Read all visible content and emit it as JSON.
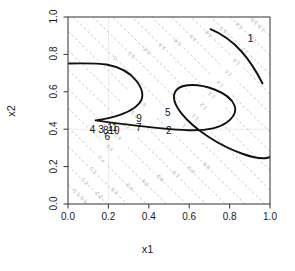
{
  "chart_data": {
    "type": "line",
    "title": "",
    "xlabel": "x1",
    "ylabel": "x2",
    "xlim": [
      0.0,
      1.0
    ],
    "ylim": [
      0.0,
      1.0
    ],
    "grid": false,
    "xticks": [
      "0.0",
      "0.2",
      "0.4",
      "0.6",
      "0.8",
      "1.0"
    ],
    "yticks": [
      "0.0",
      "0.2",
      "0.4",
      "0.6",
      "0.8",
      "1.0"
    ],
    "xtick_values": [
      0.0,
      0.2,
      0.4,
      0.6,
      0.8,
      1.0
    ],
    "ytick_values": [
      0.0,
      0.2,
      0.4,
      0.6,
      0.8,
      1.0
    ],
    "background_contours": {
      "style": "dashed-gray",
      "color": "#b8b8b8",
      "levels": [
        0.1,
        0.2,
        0.3,
        0.4,
        0.5,
        0.6,
        0.7,
        0.8,
        0.9,
        1.0,
        1.1,
        1.2,
        1.3,
        1.4,
        1.5,
        1.6,
        1.7,
        1.8,
        1.9
      ],
      "labels": [
        "0.1",
        "0.2",
        "0.3",
        "0.4",
        "0.5",
        "0.6",
        "0.7",
        "0.8",
        "0.9",
        "1",
        "1.1",
        "1.2",
        "1.3",
        "1.4",
        "1.5",
        "1.6",
        "1.7",
        "1.8",
        "1.9"
      ],
      "description": "family of parallel diagonal dashed contours running from lower-left to upper-right"
    },
    "highlighted_contours": {
      "style": "solid-black",
      "color": "#111111",
      "count": 2,
      "labels": [
        "1"
      ],
      "description": "thick black S-shaped curve through the middle of the panel and a short arc in the upper-right corner"
    },
    "point_labels": [
      {
        "text": "1",
        "x": 0.905,
        "y": 0.885
      },
      {
        "text": "2",
        "x": 0.5,
        "y": 0.392
      },
      {
        "text": "3",
        "x": 0.165,
        "y": 0.398
      },
      {
        "text": "4",
        "x": 0.122,
        "y": 0.398
      },
      {
        "text": "5",
        "x": 0.495,
        "y": 0.487
      },
      {
        "text": "6",
        "x": 0.196,
        "y": 0.358
      },
      {
        "text": "7",
        "x": 0.352,
        "y": 0.408
      },
      {
        "text": "8",
        "x": 0.188,
        "y": 0.393
      },
      {
        "text": "9",
        "x": 0.353,
        "y": 0.452
      },
      {
        "text": "10",
        "x": 0.215,
        "y": 0.393
      },
      {
        "text": "11",
        "x": 0.209,
        "y": 0.405
      }
    ]
  },
  "plot": {
    "xlabel": "x1",
    "ylabel": "x2"
  }
}
